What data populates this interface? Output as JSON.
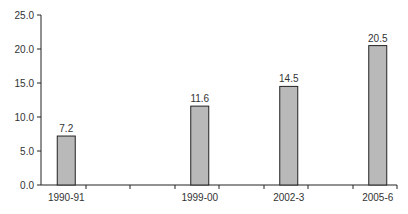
{
  "chart_data": {
    "type": "bar",
    "title": "",
    "xlabel": "",
    "ylabel": "",
    "categories": [
      "1990-91",
      "",
      "",
      "1999-00",
      "",
      "2002-3",
      "",
      "2005-6"
    ],
    "values": [
      7.2,
      null,
      null,
      11.6,
      null,
      14.5,
      null,
      20.5
    ],
    "data_labels": [
      "7.2",
      "",
      "",
      "11.6",
      "",
      "14.5",
      "",
      "20.5"
    ],
    "ylim": [
      0,
      25
    ],
    "yticks": [
      0,
      5,
      10,
      15,
      20,
      25
    ],
    "ytick_labels": [
      "0.0",
      "5.0",
      "10.0",
      "15.0",
      "20.0",
      "25.0"
    ],
    "grid": false,
    "legend": null,
    "colors": {
      "bar_fill": "#b9b9b9",
      "bar_stroke": "#222222",
      "axis": "#222222",
      "text": "#333333"
    }
  }
}
